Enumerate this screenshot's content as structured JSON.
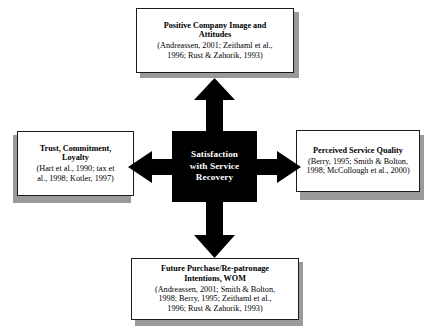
{
  "diagram": {
    "center": {
      "label": "Satisfaction\nwith Service\nRecovery",
      "line1": "Satisfaction",
      "line2": "with Service",
      "line3": "Recovery",
      "background_color": "#000000",
      "text_color": "#ffffff"
    },
    "nodes": {
      "top": {
        "title_line1": "Positive Company Image and",
        "title_line2": "Attitudes",
        "cite_line1": "(Andreassen, 2001; Zeithaml et al.,",
        "cite_line2": "1996; Rust & Zahorik, 1993)"
      },
      "left": {
        "title_line1": "Trust, Commitment,",
        "title_line2": "Loyalty",
        "cite_line1": "(Hart et al., 1990; tax et",
        "cite_line2": "al., 1998; Kotler, 1997)"
      },
      "right": {
        "title_line1": "Perceived Service Quality",
        "cite_line1": "(Berry, 1995; Smith & Bolton,",
        "cite_line2": "1998; McCollough et al., 2000)"
      },
      "bottom": {
        "title_line1": "Future Purchase/Re-patronage",
        "title_line2": "Intentions, WOM",
        "cite_line1": "(Andreassen, 2001; Smith & Bolton,",
        "cite_line2": "1998; Berry, 1995; Zeithaml et al.,",
        "cite_line3": "1996; Rust & Zahorik, 1993)"
      }
    },
    "arrows": {
      "up": "arrow-up",
      "down": "arrow-down",
      "left": "arrow-left",
      "right": "arrow-right",
      "color": "#000000"
    },
    "colors": {
      "box_border": "#1a1a1a",
      "box_face": "#ffffff",
      "box_shadow": "#9a9a9a",
      "page_background": "#ffffff"
    }
  }
}
